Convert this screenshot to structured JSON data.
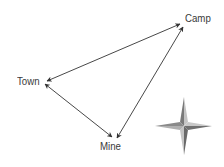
{
  "diagram": {
    "nodes": [
      {
        "id": "camp",
        "label": "Camp",
        "x": 185,
        "y": 13
      },
      {
        "id": "town",
        "label": "Town",
        "x": 17,
        "y": 76
      },
      {
        "id": "mine",
        "label": "Mine",
        "x": 100,
        "y": 141
      }
    ],
    "edges": [
      {
        "from": "town",
        "to": "camp",
        "direction": "bidirectional"
      },
      {
        "from": "camp",
        "to": "mine",
        "direction": "bidirectional"
      },
      {
        "from": "town",
        "to": "mine",
        "direction": "bidirectional"
      }
    ],
    "compass": {
      "icon": "compass-rose-icon",
      "cx": 184,
      "cy": 126
    },
    "colors": {
      "line": "#333333",
      "text": "#3a3a3a",
      "compass_light": "#b8b8b8",
      "compass_dark": "#6e6e6e"
    }
  }
}
